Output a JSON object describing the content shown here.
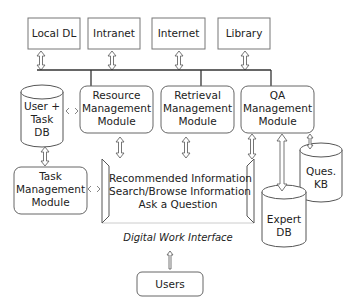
{
  "sources": {
    "local_dl": "Local DL",
    "intranet": "Intranet",
    "internet": "Internet",
    "library": "Library"
  },
  "modules": {
    "resource": [
      "Resource",
      "Management",
      "Module"
    ],
    "retrieval": [
      "Retrieval",
      "Management",
      "Module"
    ],
    "qa": [
      "QA",
      "Management",
      "Module"
    ],
    "task": [
      "Task",
      "Management",
      "Module"
    ]
  },
  "databases": {
    "user_task": [
      "User +",
      "Task",
      "DB"
    ],
    "ques_kb": [
      "Ques.",
      "KB"
    ],
    "expert": [
      "Expert",
      "DB"
    ]
  },
  "interface": {
    "items": [
      "Recommended Information",
      "Search/Browse Information",
      "Ask a Question"
    ],
    "caption": "Digital Work Interface"
  },
  "users": "Users",
  "colors": {
    "stroke": "#555555",
    "bus": "#333333",
    "text": "#222222"
  }
}
